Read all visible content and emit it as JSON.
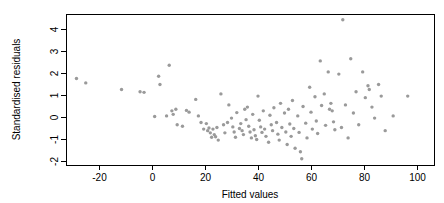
{
  "chart_data": {
    "type": "scatter",
    "title": "",
    "xlabel": "Fitted values",
    "ylabel": "Standardised residuals",
    "xlim": [
      -32,
      102
    ],
    "ylim": [
      -2.2,
      4.7
    ],
    "xticks": [
      -20,
      0,
      20,
      40,
      60,
      80,
      100
    ],
    "xtick_labels": [
      "-20",
      "0",
      "20",
      "40",
      "60",
      "80",
      "100"
    ],
    "yticks": [
      -2,
      -1,
      0,
      1,
      2,
      3,
      4
    ],
    "ytick_labels": [
      "-2",
      "-1",
      "0",
      "1",
      "2",
      "3",
      "4"
    ],
    "grid": false,
    "legend": null,
    "point_color": "#9a9a9a",
    "frame_color": "#000000",
    "points": [
      [
        -28.5,
        1.75
      ],
      [
        -25.0,
        1.55
      ],
      [
        -11.5,
        1.25
      ],
      [
        -4.5,
        1.15
      ],
      [
        -3.0,
        1.12
      ],
      [
        1.0,
        0.02
      ],
      [
        2.5,
        1.85
      ],
      [
        3.0,
        1.48
      ],
      [
        5.5,
        0.05
      ],
      [
        6.5,
        2.35
      ],
      [
        7.5,
        0.28
      ],
      [
        8.0,
        0.12
      ],
      [
        9.0,
        0.35
      ],
      [
        9.5,
        -0.35
      ],
      [
        11.5,
        -0.42
      ],
      [
        13.0,
        0.3
      ],
      [
        14.0,
        0.22
      ],
      [
        16.5,
        0.8
      ],
      [
        17.5,
        0.05
      ],
      [
        18.5,
        -0.25
      ],
      [
        19.5,
        -0.55
      ],
      [
        20.5,
        -0.3
      ],
      [
        21.0,
        -0.62
      ],
      [
        21.5,
        -0.5
      ],
      [
        22.0,
        -0.72
      ],
      [
        22.5,
        -0.92
      ],
      [
        23.0,
        -0.55
      ],
      [
        23.5,
        -0.8
      ],
      [
        24.0,
        -0.9
      ],
      [
        24.5,
        -0.48
      ],
      [
        25.0,
        -1.05
      ],
      [
        26.0,
        1.05
      ],
      [
        27.0,
        -0.35
      ],
      [
        27.5,
        -0.72
      ],
      [
        28.5,
        -0.25
      ],
      [
        29.0,
        0.55
      ],
      [
        30.0,
        -0.05
      ],
      [
        30.5,
        -0.45
      ],
      [
        31.0,
        -0.68
      ],
      [
        31.5,
        -0.92
      ],
      [
        32.0,
        0.2
      ],
      [
        33.0,
        -0.52
      ],
      [
        33.5,
        -0.3
      ],
      [
        34.0,
        -0.62
      ],
      [
        34.5,
        -0.8
      ],
      [
        35.0,
        0.35
      ],
      [
        35.5,
        -0.12
      ],
      [
        36.0,
        0.45
      ],
      [
        36.5,
        -0.42
      ],
      [
        37.0,
        -0.68
      ],
      [
        37.5,
        -0.95
      ],
      [
        38.0,
        0.12
      ],
      [
        38.5,
        -0.58
      ],
      [
        39.0,
        -0.85
      ],
      [
        39.5,
        -1.02
      ],
      [
        40.0,
        0.95
      ],
      [
        40.5,
        -0.15
      ],
      [
        41.0,
        -0.45
      ],
      [
        41.5,
        -0.7
      ],
      [
        42.0,
        0.28
      ],
      [
        42.5,
        -0.55
      ],
      [
        43.0,
        -0.88
      ],
      [
        44.0,
        -1.15
      ],
      [
        44.5,
        0.08
      ],
      [
        45.0,
        -0.35
      ],
      [
        45.5,
        -0.62
      ],
      [
        46.0,
        0.42
      ],
      [
        47.0,
        -0.25
      ],
      [
        47.5,
        -0.78
      ],
      [
        48.0,
        -1.05
      ],
      [
        48.5,
        0.62
      ],
      [
        49.0,
        -0.48
      ],
      [
        50.0,
        0.18
      ],
      [
        50.5,
        -0.68
      ],
      [
        51.0,
        -1.25
      ],
      [
        51.5,
        0.35
      ],
      [
        52.0,
        -0.32
      ],
      [
        52.5,
        -0.88
      ],
      [
        53.0,
        0.75
      ],
      [
        53.5,
        -0.52
      ],
      [
        54.0,
        -1.42
      ],
      [
        55.0,
        0.05
      ],
      [
        55.5,
        -0.7
      ],
      [
        56.0,
        -1.58
      ],
      [
        56.5,
        -1.9
      ],
      [
        57.0,
        0.48
      ],
      [
        58.0,
        -0.28
      ],
      [
        58.5,
        -0.95
      ],
      [
        59.5,
        1.35
      ],
      [
        60.0,
        0.22
      ],
      [
        60.5,
        -0.55
      ],
      [
        61.5,
        0.92
      ],
      [
        62.0,
        -0.18
      ],
      [
        62.5,
        -0.75
      ],
      [
        63.5,
        2.55
      ],
      [
        64.0,
        0.52
      ],
      [
        65.0,
        1.05
      ],
      [
        65.5,
        -0.38
      ],
      [
        66.5,
        2.05
      ],
      [
        67.0,
        0.35
      ],
      [
        67.5,
        0.62
      ],
      [
        68.0,
        0.28
      ],
      [
        68.5,
        -0.22
      ],
      [
        69.0,
        -0.58
      ],
      [
        70.5,
        1.95
      ],
      [
        71.5,
        -0.48
      ],
      [
        72.0,
        4.42
      ],
      [
        73.0,
        0.55
      ],
      [
        74.0,
        -0.95
      ],
      [
        75.0,
        2.65
      ],
      [
        76.0,
        0.18
      ],
      [
        77.0,
        1.15
      ],
      [
        78.0,
        -0.35
      ],
      [
        79.5,
        2.05
      ],
      [
        80.5,
        0.88
      ],
      [
        81.5,
        1.42
      ],
      [
        82.0,
        1.25
      ],
      [
        83.0,
        0.45
      ],
      [
        84.0,
        -0.05
      ],
      [
        85.5,
        1.48
      ],
      [
        86.5,
        0.95
      ],
      [
        88.0,
        -0.62
      ],
      [
        91.0,
        0.05
      ],
      [
        96.5,
        0.95
      ]
    ]
  },
  "axes": {
    "x_title": "Fitted values",
    "y_title": "Standardised residuals"
  }
}
